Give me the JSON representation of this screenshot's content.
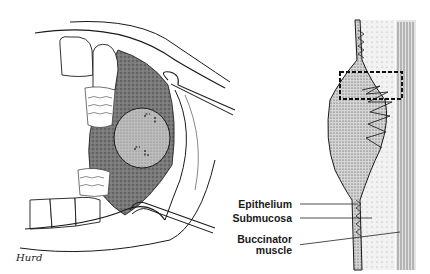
{
  "figure": {
    "left_panel": {
      "description": "Oral cavity view with cheek retracted showing buccal submucosal mass",
      "signature": "Hurd"
    },
    "right_panel": {
      "description": "Cross-section of buccal mucosa lesion",
      "labels": [
        {
          "text": "Epithelium"
        },
        {
          "text": "Submucosa"
        },
        {
          "text": "Buccinator"
        },
        {
          "text": "muscle"
        }
      ]
    },
    "colors": {
      "ink": "#1a1a1a",
      "shade": "#555555",
      "background": "#ffffff"
    }
  }
}
